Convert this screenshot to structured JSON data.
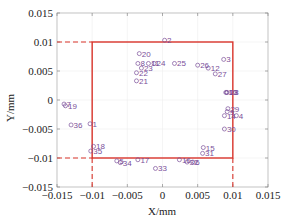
{
  "chart_data": {
    "type": "scatter",
    "title": "",
    "xlabel": "X/mm",
    "ylabel": "Y/mm",
    "xlim": [
      -0.015,
      0.015
    ],
    "ylim": [
      -0.015,
      0.015
    ],
    "grid": true,
    "x_ticks": [
      "-0.015",
      "-0.01",
      "-0.005",
      "0",
      "0.005",
      "0.01",
      "0.015"
    ],
    "y_ticks": [
      "0.015",
      "0.01",
      "0.005",
      "0",
      "-0.005",
      "-0.01",
      "-0.015"
    ],
    "boundary_square": {
      "x": [
        -0.01,
        0.01
      ],
      "y": [
        -0.01,
        0.01
      ],
      "color": "#d9342b"
    },
    "marker_color": "#7a4f9a",
    "points": [
      {
        "id": "1",
        "x": -0.0103,
        "y": -0.0041
      },
      {
        "id": "2",
        "x": 0.0003,
        "y": 0.0103
      },
      {
        "id": "3",
        "x": 0.0087,
        "y": 0.007
      },
      {
        "id": "4",
        "x": 0.0105,
        "y": -0.0027
      },
      {
        "id": "5",
        "x": -0.0065,
        "y": -0.0105
      },
      {
        "id": "6",
        "x": 0.0043,
        "y": -0.0107
      },
      {
        "id": "7",
        "x": -0.014,
        "y": -0.0007
      },
      {
        "id": "8",
        "x": -0.0035,
        "y": 0.0063
      },
      {
        "id": "9",
        "x": 0.0092,
        "y": -0.002
      },
      {
        "id": "10",
        "x": 0.009,
        "y": 0.0013
      },
      {
        "id": "11",
        "x": -0.002,
        "y": 0.0063
      },
      {
        "id": "12",
        "x": 0.0065,
        "y": 0.0055
      },
      {
        "id": "13",
        "x": 0.0091,
        "y": 0.0013
      },
      {
        "id": "14",
        "x": 0.0088,
        "y": -0.0027
      },
      {
        "id": "15",
        "x": 0.0058,
        "y": -0.0082
      },
      {
        "id": "16",
        "x": 0.0024,
        "y": -0.0103
      },
      {
        "id": "17",
        "x": -0.0035,
        "y": -0.0103
      },
      {
        "id": "18",
        "x": -0.0098,
        "y": -0.008
      },
      {
        "id": "19",
        "x": -0.0138,
        "y": -0.001
      },
      {
        "id": "20",
        "x": -0.0033,
        "y": 0.008
      },
      {
        "id": "21",
        "x": -0.0037,
        "y": 0.0033
      },
      {
        "id": "22",
        "x": -0.0037,
        "y": 0.0047
      },
      {
        "id": "23",
        "x": -0.003,
        "y": 0.0055
      },
      {
        "id": "24",
        "x": -0.0012,
        "y": 0.0063
      },
      {
        "id": "25",
        "x": 0.0017,
        "y": 0.0063
      },
      {
        "id": "26",
        "x": 0.005,
        "y": 0.006
      },
      {
        "id": "27",
        "x": 0.0075,
        "y": 0.0045
      },
      {
        "id": "28",
        "x": 0.0092,
        "y": 0.0013
      },
      {
        "id": "29",
        "x": 0.0093,
        "y": -0.0015
      },
      {
        "id": "30",
        "x": 0.0088,
        "y": -0.005
      },
      {
        "id": "31",
        "x": 0.0057,
        "y": -0.0092
      },
      {
        "id": "32",
        "x": 0.0035,
        "y": -0.0107
      },
      {
        "id": "33",
        "x": -0.001,
        "y": -0.0118
      },
      {
        "id": "34",
        "x": -0.006,
        "y": -0.0108
      },
      {
        "id": "35",
        "x": -0.0102,
        "y": -0.0088
      },
      {
        "id": "36",
        "x": -0.013,
        "y": -0.0043
      }
    ]
  }
}
